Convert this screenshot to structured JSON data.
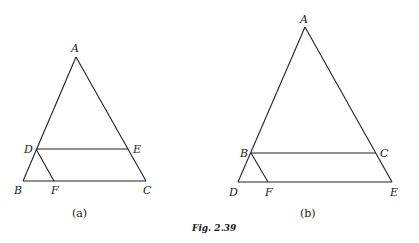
{
  "figure": {
    "caption": "Fig. 2.39",
    "panels": [
      {
        "id": "a",
        "sublabel": "(a)",
        "points": {
          "A": {
            "label": "A",
            "x": 76,
            "y": 57
          },
          "B": {
            "label": "B",
            "x": 23,
            "y": 181
          },
          "C": {
            "label": "C",
            "x": 146,
            "y": 181
          },
          "D": {
            "label": "D",
            "x": 36,
            "y": 149
          },
          "E": {
            "label": "E",
            "x": 128,
            "y": 149
          },
          "F": {
            "label": "F",
            "x": 54,
            "y": 181
          }
        },
        "segments": [
          "AB",
          "AC",
          "BC",
          "DE",
          "DF"
        ]
      },
      {
        "id": "b",
        "sublabel": "(b)",
        "points": {
          "A": {
            "label": "A",
            "x": 305,
            "y": 27
          },
          "B": {
            "label": "B",
            "x": 251,
            "y": 153
          },
          "C": {
            "label": "C",
            "x": 376,
            "y": 153
          },
          "D": {
            "label": "D",
            "x": 238,
            "y": 182
          },
          "E": {
            "label": "E",
            "x": 392,
            "y": 182
          },
          "F": {
            "label": "F",
            "x": 268,
            "y": 182
          }
        },
        "segments": [
          "AD",
          "AE",
          "DE",
          "BC",
          "BF"
        ]
      }
    ]
  }
}
